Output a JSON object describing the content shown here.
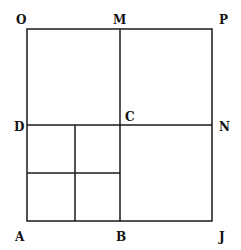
{
  "diagram": {
    "title": "",
    "labels": {
      "O": "O",
      "M": "M",
      "P": "P",
      "D": "D",
      "C": "C",
      "N": "N",
      "A": "A",
      "B": "B",
      "J": "J"
    },
    "stroke_color": "#1a1a1a",
    "background": "#ffffff"
  }
}
